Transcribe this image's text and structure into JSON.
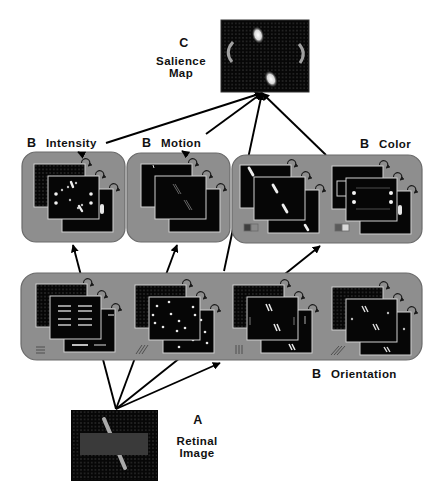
{
  "diagram": {
    "salience_map": {
      "letter": "C",
      "line1": "Salience",
      "line2": "Map"
    },
    "retinal_image": {
      "letter": "A",
      "line1": "Retinal",
      "line2": "Image"
    },
    "feature_channels": {
      "intensity": {
        "letter": "B",
        "label": "Intensity"
      },
      "motion": {
        "letter": "B",
        "label": "Motion"
      },
      "color": {
        "letter": "B",
        "label": "Color",
        "subchannels": [
          {
            "icon": "red-green-swatch-icon",
            "colors": [
              "#3e3e3e",
              "#8a8a8a"
            ]
          },
          {
            "icon": "blue-yellow-swatch-icon",
            "colors": [
              "#5a5a5a",
              "#d9d9d9"
            ]
          }
        ]
      },
      "orientation": {
        "letter": "B",
        "label": "Orientation",
        "subchannels": [
          {
            "icon": "horizontal-lines-icon"
          },
          {
            "icon": "diagonal-right-lines-icon"
          },
          {
            "icon": "vertical-lines-icon"
          },
          {
            "icon": "diagonal-left-lines-icon"
          }
        ]
      }
    }
  },
  "colors": {
    "panel_fill": "#8e8e8e",
    "panel_border": "#6a6a6a",
    "map_background": "#060606",
    "arrow": "#000000"
  }
}
